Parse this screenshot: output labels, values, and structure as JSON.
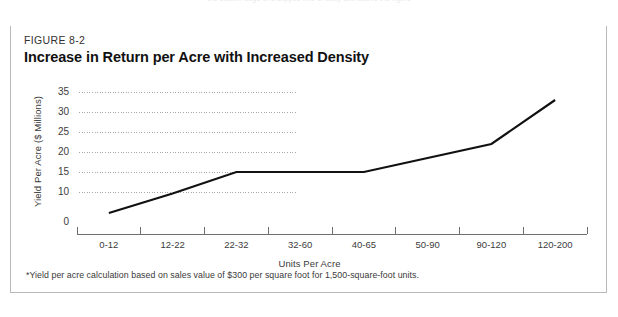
{
  "page": {
    "top_clipped_text": "the bottom edge of a clipped line of body text above the figure"
  },
  "figure": {
    "number": "FIGURE 8-2",
    "title": "Increase in Return per Acre with Increased Density",
    "footnote": "*Yield per acre calculation based on sales value of $300 per square foot for 1,500-square-foot units.",
    "frame_accent_color": "#111111",
    "frame_border_color": "#b9b9b9"
  },
  "chart_data": {
    "type": "line",
    "title": "Increase in Return per Acre with Increased Density",
    "subtitle": "FIGURE 8-2",
    "xlabel": "Units Per Acre",
    "ylabel": "Yield Per Acre ($ Millions)",
    "categories": [
      "0-12",
      "12-22",
      "22-32",
      "32-60",
      "40-65",
      "50-90",
      "90-120",
      "120-200"
    ],
    "values": [
      3,
      9.5,
      15,
      15,
      15,
      18.5,
      22,
      33
    ],
    "ytick_labels": [
      "0",
      "10",
      "15",
      "20",
      "25",
      "30",
      "35"
    ],
    "ytick_values": [
      0,
      10,
      15,
      20,
      25,
      30,
      35
    ],
    "ylim": [
      0,
      35
    ],
    "grid": "horizontal-dotted-partial",
    "legend": "none",
    "line_color": "#111111",
    "line_width": 2.2,
    "gridline_color": "#a8a8a8",
    "axis_color": "#6f6f6f"
  }
}
